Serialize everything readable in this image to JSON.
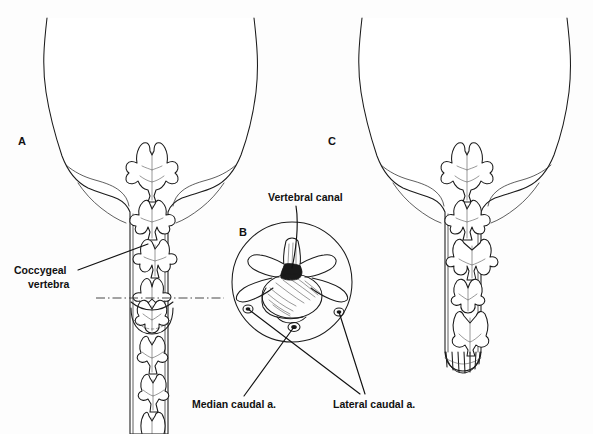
{
  "figure": {
    "background_color": "#fdfdfd",
    "line_color": "#1a1a1a",
    "text_color": "#111111",
    "width": 593,
    "height": 434
  },
  "panels": [
    {
      "id": "A",
      "label": "A",
      "label_x": 22,
      "label_y": 145,
      "description": "Dorsal view of intact canine rump and full tail showing coccygeal vertebrae and the level of amputation"
    },
    {
      "id": "B",
      "label": "B",
      "label_x": 243,
      "label_y": 236,
      "description": "Cross-section of a coccygeal vertebra at the docking site showing the vertebral canal and caudal arteries"
    },
    {
      "id": "C",
      "label": "C",
      "label_x": 332,
      "label_y": 145,
      "description": "Dorsal view of the rump after the tail has been docked, with sutured stump"
    }
  ],
  "annotations": [
    {
      "name": "coccygeal-vertebra",
      "text_line1": "Coccygeal",
      "text_line2": "vertebra",
      "text_x": 14,
      "text_y": 274,
      "leader": {
        "x1": 78,
        "y1": 270,
        "x2": 148,
        "y2": 244
      }
    },
    {
      "name": "vertebral-canal",
      "text_line1": "Vertebral canal",
      "text_line2": "",
      "text_x": 268,
      "text_y": 201,
      "leader": {
        "x1": 296,
        "y1": 206,
        "x2": 293,
        "y2": 268
      }
    },
    {
      "name": "median-caudal-artery",
      "text_line1": "Median caudal a.",
      "text_line2": "",
      "text_x": 192,
      "text_y": 408,
      "leader": {
        "x1": 244,
        "y1": 396,
        "x2": 294,
        "y2": 327
      }
    },
    {
      "name": "lateral-caudal-artery",
      "text_line1": "Lateral caudal a.",
      "text_line2": "",
      "text_x": 333,
      "text_y": 408,
      "leader_left": {
        "x1": 360,
        "y1": 394,
        "x2": 248,
        "y2": 309
      },
      "leader_right": {
        "x1": 365,
        "y1": 394,
        "x2": 339,
        "y2": 312
      }
    }
  ],
  "cut_line": {
    "name": "amputation-level",
    "style": "dash-dot",
    "x1": 96,
    "x2": 224,
    "y": 298
  },
  "inset_circle": {
    "cx": 292,
    "cy": 282,
    "r": 60
  }
}
